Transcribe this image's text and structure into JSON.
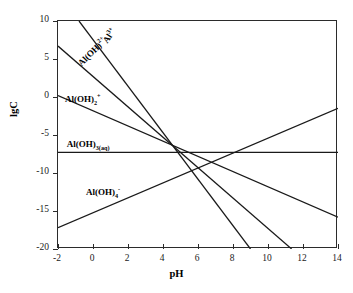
{
  "chart_data": {
    "type": "line",
    "title": "",
    "xlabel": "pH",
    "ylabel": "lgC",
    "xlim": [
      -2,
      14
    ],
    "ylim": [
      -20,
      10
    ],
    "xticks": [
      -2,
      0,
      2,
      4,
      6,
      8,
      10,
      12,
      14
    ],
    "yticks": [
      10,
      5,
      0,
      -5,
      -10,
      -15,
      -20
    ],
    "xtick_labels": [
      "-2",
      "0",
      "2",
      "4",
      "6",
      "8",
      "10",
      "12",
      "14"
    ],
    "ytick_labels": [
      "10",
      "5",
      "0",
      "-5",
      "-10",
      "-15",
      "-20"
    ],
    "grid": false,
    "legend_position": "inline-annotations",
    "line_color": "#1a1a1a",
    "series": [
      {
        "name": "Al3+",
        "label_html": "Al<sup>3+</sup>",
        "slope": -3,
        "intercept": 7.4,
        "x": [
          -0.8,
          9.0
        ],
        "y": [
          10,
          -20
        ]
      },
      {
        "name": "Al(OH)2+",
        "label_html": "Al(OH)<sup>2+</sup>",
        "slope": -2,
        "intercept": 2.7,
        "x": [
          -2,
          11.35
        ],
        "y": [
          6.7,
          -20
        ]
      },
      {
        "name": "Al(OH)2+ (dihydroxo)",
        "label_html": "Al(OH)<sub>2</sub><sup>+</sup>",
        "slope": -1,
        "intercept": -1.8,
        "x": [
          -2,
          14
        ],
        "y": [
          0.2,
          -15.8
        ]
      },
      {
        "name": "Al(OH)3(aq)",
        "label_html": "Al(OH)<sub>3(aq)</sub>",
        "slope": 0,
        "intercept": -7.3,
        "x": [
          -2,
          14
        ],
        "y": [
          -7.3,
          -7.3
        ]
      },
      {
        "name": "Al(OH)4-",
        "label_html": "Al(OH)<sub>4</sub><sup>-</sup>",
        "slope": 0.98,
        "intercept": -15.25,
        "x": [
          -2,
          14
        ],
        "y": [
          -17.2,
          -1.5
        ]
      }
    ],
    "annotations": [
      {
        "text": "Al3+",
        "x": 0.9,
        "y": 8.0,
        "rotation": -55
      },
      {
        "text": "Al(OH)2+",
        "x": -0.6,
        "y": 5.0,
        "rotation": -45
      },
      {
        "text": "Al(OH)2+",
        "x": -1.6,
        "y": 0.2,
        "rotation": 0
      },
      {
        "text": "Al(OH)3(aq)",
        "x": -1.5,
        "y": -5.6,
        "rotation": 0
      },
      {
        "text": "Al(OH)4-",
        "x": -0.4,
        "y": -12.0,
        "rotation": 0
      }
    ]
  },
  "labels": {
    "al3": {
      "base": "Al",
      "sup": "3+",
      "sub": ""
    },
    "aloh2": {
      "base": "Al(OH)",
      "sup": "2+",
      "sub": ""
    },
    "aloh2plus": {
      "base": "Al(OH)",
      "sup": "+",
      "sub": "2"
    },
    "aloh3aq": {
      "base": "Al(OH)",
      "sup": "",
      "sub": "3(aq)"
    },
    "aloh4": {
      "base": "Al(OH)",
      "sup": "-",
      "sub": "4"
    }
  },
  "axes": {
    "x_title": "pH",
    "y_title": "lgC"
  }
}
